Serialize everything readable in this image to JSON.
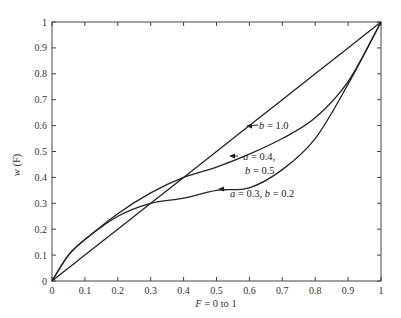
{
  "chart_data": {
    "type": "line",
    "title": "",
    "xlabel": "F = 0 to 1",
    "ylabel": "w (F)",
    "xlim": [
      0,
      1
    ],
    "ylim": [
      0,
      1
    ],
    "grid": false,
    "legend": "none (inline annotations with arrows)",
    "x_ticks": [
      "0",
      "0.1",
      "0.2",
      "0.3",
      "0.4",
      "0.5",
      "0.6",
      "0.7",
      "0.8",
      "0.9",
      "1"
    ],
    "y_ticks": [
      "0",
      "0.1",
      "0.2",
      "0.3",
      "0.4",
      "0.5",
      "0.6",
      "0.7",
      "0.8",
      "0.9",
      "1"
    ],
    "x": [
      0,
      0.05,
      0.1,
      0.2,
      0.3,
      0.4,
      0.5,
      0.6,
      0.7,
      0.8,
      0.9,
      1.0
    ],
    "series": [
      {
        "name": "b = 1.0",
        "values": [
          0,
          0.05,
          0.1,
          0.2,
          0.3,
          0.4,
          0.5,
          0.6,
          0.7,
          0.8,
          0.9,
          1.0
        ]
      },
      {
        "name": "a = 0.4, b = 0.5",
        "values": [
          0,
          0.1,
          0.16,
          0.26,
          0.34,
          0.4,
          0.44,
          0.49,
          0.55,
          0.63,
          0.77,
          1.0
        ]
      },
      {
        "name": "a = 0.3, b = 0.2",
        "values": [
          0,
          0.1,
          0.16,
          0.25,
          0.3,
          0.32,
          0.35,
          0.36,
          0.43,
          0.55,
          0.76,
          1.0
        ]
      }
    ],
    "annotations": [
      {
        "text": "b = 1.0",
        "points_to": [
          0.59,
          0.6
        ]
      },
      {
        "text": "a = 0.4,",
        "text2": "b = 0.5",
        "points_to": [
          0.55,
          0.48
        ]
      },
      {
        "text": "a = 0.3, b = 0.2",
        "points_to": [
          0.5,
          0.34
        ]
      }
    ]
  },
  "labels": {
    "ylabel_main": "w",
    "ylabel_paren": " (F)",
    "xlabel_var": "F",
    "xlabel_rest": " = 0 to 1",
    "ann1_var": "b",
    "ann1_rest": " = 1.0",
    "ann2a_var": "a",
    "ann2a_rest": " = 0.4,",
    "ann2b_var": "b",
    "ann2b_rest": " = 0.5",
    "ann3_var1": "a",
    "ann3_mid": " = 0.3, ",
    "ann3_var2": "b",
    "ann3_rest": " = 0.2"
  }
}
